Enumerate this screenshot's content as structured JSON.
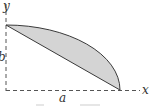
{
  "diagram": {
    "labels": {
      "y_axis": "y",
      "x_axis": "x",
      "height": "b",
      "width": "a"
    },
    "caption": "",
    "colors": {
      "stroke": "#3a3a3a",
      "axis": "#555555",
      "fill": "#d4d4d4"
    },
    "region": "area between chord and elliptical arc from (0,b) to (a,0)"
  }
}
